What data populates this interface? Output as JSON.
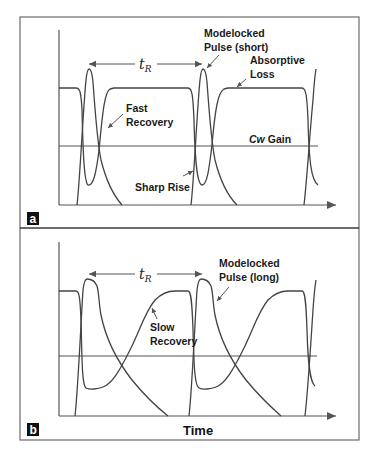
{
  "figure": {
    "panel_a": {
      "badge": "a",
      "period_label": "t",
      "period_subscript": "R",
      "annotations": {
        "pulse_line1": "Modelocked",
        "pulse_line2": "Pulse (short)",
        "loss_line1": "Absorptive",
        "loss_line2": "Loss",
        "recovery_line1": "Fast",
        "recovery_line2": "Recovery",
        "gain_italic": "Cw",
        "gain_text": "Gain",
        "rise": "Sharp Rise"
      }
    },
    "panel_b": {
      "badge": "b",
      "period_label": "t",
      "period_subscript": "R",
      "annotations": {
        "pulse_line1": "Modelocked",
        "pulse_line2": "Pulse (long)",
        "recovery_line1": "Slow",
        "recovery_line2": "Recovery"
      },
      "x_axis_label": "Time"
    },
    "colors": {
      "line": "#444444",
      "badge": "#111111",
      "background": "#ffffff"
    }
  }
}
